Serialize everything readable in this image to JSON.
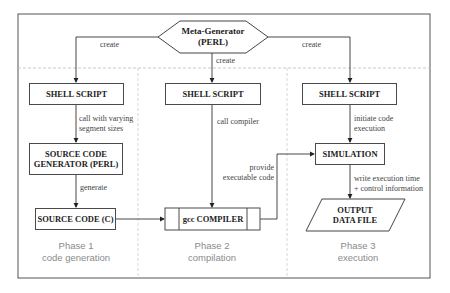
{
  "meta_generator": {
    "line1": "Meta-Generator",
    "line2": "(PERL)"
  },
  "edges": {
    "create_left": "create",
    "create_mid": "create",
    "create_right": "create",
    "call_varying_1": "call with varying",
    "call_varying_2": "segment sizes",
    "generate": "generate",
    "call_compiler": "call compiler",
    "provide_1": "provide",
    "provide_2": "executable code",
    "initiate_1": "initiate code",
    "initiate_2": "execution",
    "write_1": "write execution time",
    "write_2": "+ control information"
  },
  "nodes": {
    "shell1": "SHELL SCRIPT",
    "shell2": "SHELL SCRIPT",
    "shell3": "SHELL SCRIPT",
    "srcgen_1": "SOURCE CODE",
    "srcgen_2": "GENERATOR (PERL)",
    "srccode": "SOURCE CODE (C)",
    "gcc": "gcc COMPILER",
    "simulation": "SIMULATION",
    "output_1": "OUTPUT",
    "output_2": "DATA FILE"
  },
  "phases": [
    {
      "title": "Phase 1",
      "subtitle": "code generation"
    },
    {
      "title": "Phase 2",
      "subtitle": "compilation"
    },
    {
      "title": "Phase 3",
      "subtitle": "execution"
    }
  ]
}
